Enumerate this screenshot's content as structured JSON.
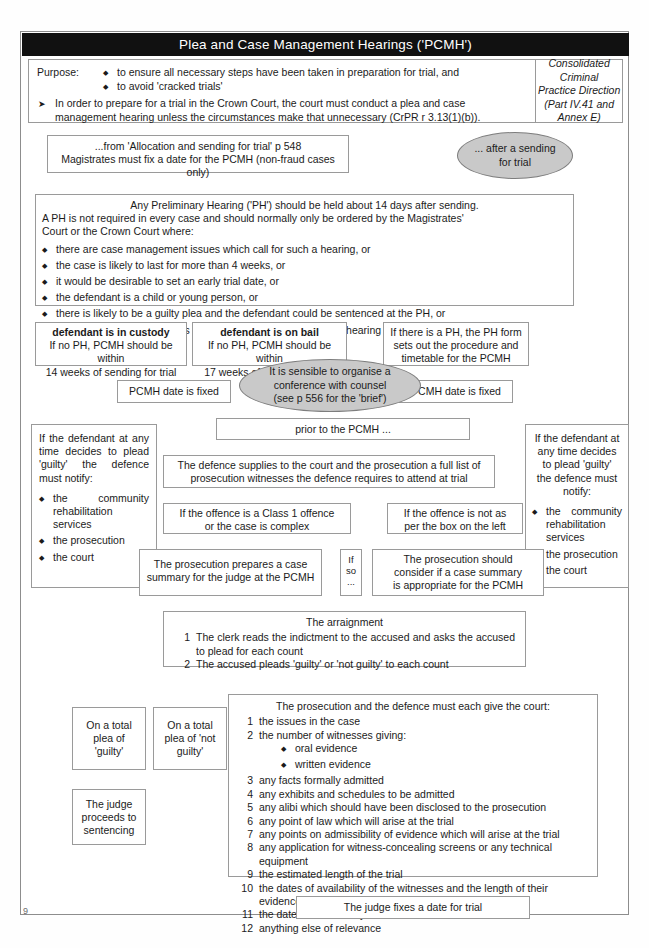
{
  "page": {
    "number": "9"
  },
  "header": {
    "title": "Plea and Case Management Hearings ('PCMH')",
    "purpose_label": "Purpose:",
    "purpose_bullets": [
      "to ensure all necessary steps have been taken in preparation for trial, and",
      "to avoid 'cracked trials'"
    ],
    "arrow_note": "In order to prepare for a trial in the Crown Court, the court must conduct a plea and case management hearing unless the circumstances make that unnecessary (CrPR r 3.13(1)(b)).",
    "reference": {
      "line1": "Consolidated Criminal",
      "line2": "Practice Direction",
      "line3": "(Part IV.41 and Annex E)"
    }
  },
  "nodes": {
    "allocation": {
      "line1": "...from 'Allocation and sending for trial' p 548",
      "line2": "Magistrates must fix a date for the PCMH (non-fraud cases only)"
    },
    "after_sending": {
      "line1": "... after a sending",
      "line2": "for trial"
    },
    "preliminary_hearing": {
      "line1": "Any Preliminary Hearing ('PH') should be held about 14 days after sending.",
      "line2": "A PH is not required in every case and should normally only be ordered by the Magistrates'",
      "line3": "Court or the Crown Court where:",
      "bullets": [
        "there are case management issues which call for such a hearing, or",
        "the case is likely to last for more than 4 weeks, or",
        "it would be desirable to set an early trial date, or",
        "the defendant is a child or young person, or",
        "there is likely to be a guilty plea and the defendant could be sentenced at the PH, or",
        "it seems to the court that it is a case suitable for a preparatory hearing (see p 559)"
      ]
    },
    "in_custody": {
      "line1": "defendant is in custody",
      "line2": "If no PH, PCMH should be within",
      "line3": "14 weeks of sending for trial"
    },
    "on_bail": {
      "line1": "defendant is on bail",
      "line2": "If no PH, PCMH should be within",
      "line3": "17 weeks of sending for trial"
    },
    "ph_form": {
      "line1": "If there is a PH, the PH form",
      "line2": "sets out the procedure and",
      "line3": "timetable for the PCMH"
    },
    "pcmh_date_left": "PCMH date is fixed",
    "pcmh_date_right": "PCMH date is fixed",
    "conference": {
      "line1": "It is sensible to organise a",
      "line2": "conference with counsel",
      "line3": "(see p 556 for the 'brief')"
    },
    "prior_to_pcmh": "prior to the PCMH ...",
    "defence_notify_left": {
      "heading": "If the defendant at any time decides to plead 'guilty' the defence must notify:",
      "bullets": [
        "the community rehabilitation services",
        "the prosecution",
        "the court"
      ]
    },
    "defence_notify_right": {
      "heading_lines": [
        "If the defendant at",
        "any time decides",
        "to plead 'guilty'",
        "the defence must",
        "notify:"
      ],
      "bullets": [
        "the community rehabilitation services",
        "the prosecution",
        "the court"
      ]
    },
    "defence_supplies": {
      "line1": "The defence supplies to the court and the prosecution a full list of",
      "line2": "prosecution witnesses the defence requires to attend at trial"
    },
    "class1": {
      "line1": "If the offence is a Class 1 offence",
      "line2": "or the case is complex"
    },
    "not_as_left": {
      "line1": "If the offence is not as",
      "line2": "per the box on the left"
    },
    "prosecution_prepares": {
      "line1": "The prosecution prepares a case",
      "line2": "summary for the judge at the PCMH"
    },
    "if_so": {
      "line1": "If",
      "line2": "so",
      "line3": "..."
    },
    "prosecution_should": {
      "line1": "The prosecution should",
      "line2": "consider if a case summary",
      "line3": "is appropriate for the PCMH"
    },
    "arraignment": {
      "heading": "The arraignment",
      "items": [
        {
          "n": "1",
          "text": "The clerk reads the indictment to the accused and asks the accused to plead for each count"
        },
        {
          "n": "2",
          "text": "The accused pleads 'guilty' or 'not guilty' to each count"
        }
      ]
    },
    "plea_guilty": {
      "line1": "On a total",
      "line2": "plea of",
      "line3": "'guilty'"
    },
    "plea_not_guilty": {
      "line1": "On a total",
      "line2": "plea of 'not",
      "line3": "guilty'"
    },
    "judge_sentencing": {
      "line1": "The judge",
      "line2": "proceeds to",
      "line3": "sentencing"
    },
    "must_give_court": {
      "heading": "The prosecution and the defence must each give the court:",
      "items": [
        {
          "n": "1",
          "text": "the issues in the case"
        },
        {
          "n": "2",
          "text": "the number of witnesses giving:"
        },
        {
          "n": "3",
          "text": "any facts formally admitted"
        },
        {
          "n": "4",
          "text": "any exhibits and schedules to be admitted"
        },
        {
          "n": "5",
          "text": "any alibi which should have been disclosed to the prosecution"
        },
        {
          "n": "6",
          "text": "any point of law which will arise at the trial"
        },
        {
          "n": "7",
          "text": "any points on admissibility of evidence which will arise at the trial"
        },
        {
          "n": "8",
          "text": "any application for witness-concealing screens or any technical equipment"
        },
        {
          "n": "9",
          "text": "the estimated length of the trial"
        },
        {
          "n": "10",
          "text": "the dates of availability of the witnesses and the length of their evidence"
        },
        {
          "n": "11",
          "text": "the dates of availability of the advocates"
        },
        {
          "n": "12",
          "text": "anything else of relevance"
        }
      ],
      "sub_bullets": [
        "oral evidence",
        "written evidence"
      ]
    },
    "judge_fixes_date": "The judge fixes a date for trial"
  },
  "colors": {
    "title_bg": "#111111",
    "title_fg": "#ffffff",
    "box_border": "#9a9a9a",
    "ellipse_fill": "#c9c9c9",
    "page_bg": "#ffffff"
  }
}
